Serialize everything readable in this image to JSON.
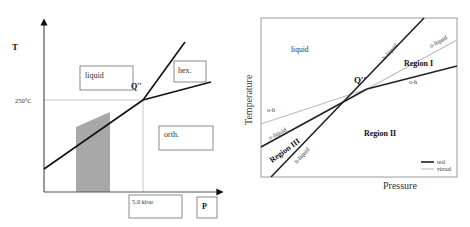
{
  "left_diagram": {
    "axis_y_label": "T",
    "axis_x_label": "P",
    "temp_marker": "250°C",
    "pressure_marker": "5.0 kbar",
    "triple_point_label": "Q′′",
    "regions": {
      "liquid": "liquid",
      "hex": "hex.",
      "orth": "orth."
    },
    "colors": {
      "line": "#111111",
      "shaded": "#a8a8a8",
      "guide": "#c8c8c8"
    }
  },
  "right_diagram": {
    "axis_y_label": "Temperature",
    "axis_x_label": "Pressure",
    "triple_point_label": "Q′′",
    "regions": {
      "liquid": "liquid",
      "region_1": "Region I",
      "region_2": "Region II",
      "region_3": "Region III"
    },
    "line_labels": {
      "h_liquid_upper": "h-liquid",
      "o_liquid_upper": "o-liquid",
      "o_h_right": "o-h",
      "o_h_left": "o-h",
      "o_liquid_lower": "o-liquid",
      "h_liquid_lower": "h-liquid"
    },
    "legend": {
      "real": "real",
      "virtual": "virtual"
    },
    "colors": {
      "real": "#222222",
      "virtual": "#bdbdbd",
      "frame": "#9a9a9a"
    }
  }
}
